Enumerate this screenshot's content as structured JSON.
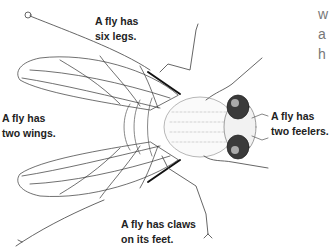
{
  "figure": {
    "labels": {
      "legs": [
        "A fly has",
        "six legs."
      ],
      "wings": [
        "A fly has",
        "two wings."
      ],
      "feelers": [
        "A fly has",
        "two feelers."
      ],
      "claws": [
        "A fly has claws",
        "on its feet."
      ]
    },
    "cropped_side_text": [
      "w",
      "a",
      "h"
    ]
  },
  "colors": {
    "ink": "#222222",
    "line": "#333333",
    "hair": "#999999",
    "eye": "#3a3a3a",
    "side_text": "#777777"
  }
}
